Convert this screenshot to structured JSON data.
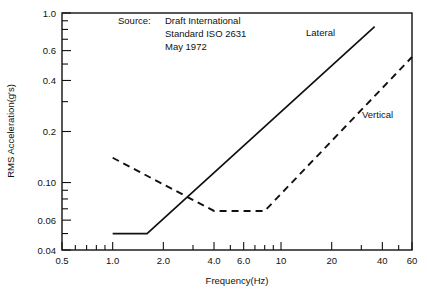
{
  "chart_data": {
    "type": "line",
    "title": "",
    "xlabel": "Frequency(Hz)",
    "ylabel": "RMS Acceleration(g's)",
    "xscale": "log",
    "yscale": "log",
    "xlim": [
      0.5,
      60
    ],
    "ylim": [
      0.04,
      1.0
    ],
    "grid": false,
    "legend_position": "inline-annotation",
    "x_tick_labels": [
      "0.5",
      "1.0",
      "2.0",
      "4.0",
      "6.0",
      "10",
      "20",
      "40",
      "60"
    ],
    "x_tick_values": [
      0.5,
      1.0,
      2.0,
      4.0,
      6.0,
      10,
      20,
      40,
      60
    ],
    "x_minor_ticks": [
      0.6,
      0.7,
      0.8,
      0.9,
      3.0,
      5.0,
      7.0,
      8.0,
      9.0,
      30,
      50
    ],
    "y_tick_labels": [
      "0.04",
      "0.06",
      "0.10",
      "0.2",
      "0.4",
      "0.6",
      "1.0"
    ],
    "y_tick_values": [
      0.04,
      0.06,
      0.1,
      0.2,
      0.4,
      0.6,
      1.0
    ],
    "y_minor_ticks": [
      0.05,
      0.07,
      0.08,
      0.09,
      0.3,
      0.5,
      0.7,
      0.8,
      0.9
    ],
    "series": [
      {
        "name": "Lateral",
        "style": "solid",
        "color": "#111111",
        "label_x": 36,
        "label_y": 0.83,
        "points": [
          {
            "x": 1.0,
            "y": 0.05
          },
          {
            "x": 1.6,
            "y": 0.05
          },
          {
            "x": 36.0,
            "y": 0.83
          }
        ]
      },
      {
        "name": "Vertical",
        "style": "dashed",
        "color": "#111111",
        "label_x": 60,
        "label_y": 0.55,
        "points": [
          {
            "x": 1.0,
            "y": 0.14
          },
          {
            "x": 4.0,
            "y": 0.068
          },
          {
            "x": 8.0,
            "y": 0.068
          },
          {
            "x": 60.0,
            "y": 0.55
          }
        ]
      }
    ],
    "annotations": [
      {
        "name": "source-note",
        "lines": [
          {
            "key": "Source:",
            "value": "Draft International"
          },
          {
            "key": "",
            "value": "Standard ISO 2631"
          },
          {
            "key": "",
            "value": "May 1972"
          }
        ]
      }
    ]
  },
  "source_note": {
    "label": "Source:",
    "line1": "Draft International",
    "line2": "Standard ISO 2631",
    "line3": "May 1972"
  },
  "axes": {
    "x_title": "Frequency(Hz)",
    "y_title": "RMS Acceleration(g's)",
    "x_ticks": [
      {
        "label": "0.5"
      },
      {
        "label": "1.0"
      },
      {
        "label": "2.0"
      },
      {
        "label": "4.0"
      },
      {
        "label": "6.0"
      },
      {
        "label": "10"
      },
      {
        "label": "20"
      },
      {
        "label": "40"
      },
      {
        "label": "60"
      }
    ],
    "y_ticks": [
      {
        "label": "1.0"
      },
      {
        "label": "0.6"
      },
      {
        "label": "0.4"
      },
      {
        "label": "0.2"
      },
      {
        "label": "0.10"
      },
      {
        "label": "0.06"
      },
      {
        "label": "0.04"
      }
    ]
  },
  "series_labels": {
    "lateral": "Lateral",
    "vertical": "Vertical"
  },
  "colors": {
    "line": "#111111",
    "background": "#ffffff",
    "frame": "#111111"
  }
}
